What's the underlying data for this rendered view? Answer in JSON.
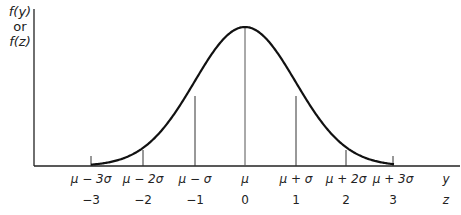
{
  "diagram": {
    "y_axis_label": {
      "line1": "f(y)",
      "line2": "or",
      "line3": "f(z)"
    },
    "y_row": {
      "axis_name": "y",
      "labels": [
        "μ − 3σ",
        "μ − 2σ",
        "μ − σ",
        "μ",
        "μ + σ",
        "μ + 2σ",
        "μ + 3σ"
      ]
    },
    "z_row": {
      "axis_name": "z",
      "labels": [
        "−3",
        "−2",
        "−1",
        "0",
        "1",
        "2",
        "3"
      ]
    },
    "markers": [
      {
        "z": -3,
        "x": 91,
        "line_top": 156
      },
      {
        "z": -2,
        "x": 143,
        "line_top": 150
      },
      {
        "z": -1,
        "x": 195,
        "line_top": 96
      },
      {
        "z": 0,
        "x": 245,
        "line_top": 27
      },
      {
        "z": 1,
        "x": 296,
        "line_top": 96
      },
      {
        "z": 2,
        "x": 346,
        "line_top": 150
      },
      {
        "z": 3,
        "x": 393,
        "line_top": 156
      }
    ],
    "colors": {
      "curve": "#111111",
      "axis": "#222222",
      "marker_lines": "#333333"
    }
  }
}
